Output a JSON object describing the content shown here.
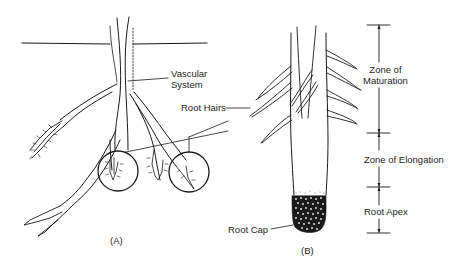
{
  "figure": {
    "panels": [
      {
        "id": "A",
        "caption": "(A)",
        "labels": {
          "vascular_system_line1": "Vascular",
          "vascular_system_line2": "System"
        }
      },
      {
        "id": "B",
        "caption": "(B)",
        "labels": {
          "root_hairs": "Root Hairs",
          "root_cap": "Root Cap"
        },
        "zones": [
          {
            "label_line1": "Zone of",
            "label_line2": "Maturation"
          },
          {
            "label_line1": "Zone of Elongation"
          },
          {
            "label_line1": "Root Apex"
          }
        ]
      }
    ],
    "colors": {
      "ink": "#1a1a1a",
      "background": "#ffffff"
    }
  }
}
